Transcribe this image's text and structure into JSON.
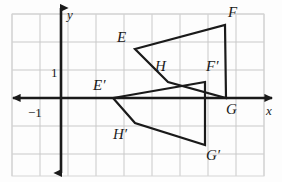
{
  "figure": {
    "width": 282,
    "height": 182,
    "background_color": "#fdfdfd",
    "grid": {
      "visible": true,
      "color": "#c9c9c9",
      "spacing_px": 28,
      "x_lines": [
        12,
        40,
        68,
        96,
        124,
        152,
        180,
        208,
        236,
        264
      ],
      "y_lines": [
        14,
        42,
        70,
        98,
        126,
        154
      ],
      "border_color": "#d5d5d5"
    },
    "axes": {
      "color": "#1a1a1a",
      "stroke_width": 2.6,
      "origin_px": [
        61,
        98
      ],
      "unit_px": 28,
      "x_axis": {
        "label": "x",
        "y_px": 98,
        "x_start_px": 13,
        "x_end_px": 272,
        "arrows": "both"
      },
      "y_axis": {
        "label": "y",
        "x_px": 61,
        "y_start_px": 8,
        "y_end_px": 173,
        "arrows": "both"
      }
    },
    "tick_labels": [
      {
        "text": "1",
        "axis": "y",
        "value": 1,
        "x_px": 51,
        "y_px": 66
      },
      {
        "text": "−1",
        "axis": "x",
        "value": -1,
        "x_px": 28,
        "y_px": 106
      }
    ],
    "shapes": [
      {
        "name": "preimage-EFGH",
        "label": "EFGH",
        "stroke": "#1a1a1a",
        "stroke_width": 2.2,
        "fill": "none",
        "closed": true,
        "vertices": [
          {
            "label": "E",
            "x_px": 135,
            "y_px": 49,
            "unit_x": 2.64,
            "unit_y": 1.75
          },
          {
            "label": "F",
            "x_px": 225,
            "y_px": 25,
            "unit_x": 5.86,
            "unit_y": 2.61
          },
          {
            "label": "G",
            "x_px": 226,
            "y_px": 98,
            "unit_x": 5.89,
            "unit_y": 0.0
          },
          {
            "label": "H",
            "x_px": 168,
            "y_px": 82,
            "unit_x": 3.82,
            "unit_y": 0.57
          }
        ]
      },
      {
        "name": "image-EFGH-prime",
        "label": "E'F'G'H'",
        "stroke": "#1a1a1a",
        "stroke_width": 2.2,
        "fill": "none",
        "closed": true,
        "vertices": [
          {
            "label": "E′",
            "x_px": 113,
            "y_px": 98,
            "unit_x": 1.86,
            "unit_y": 0.0
          },
          {
            "label": "F′",
            "x_px": 205,
            "y_px": 82,
            "unit_x": 5.14,
            "unit_y": 0.57
          },
          {
            "label": "G′",
            "x_px": 205,
            "y_px": 145,
            "unit_x": 5.14,
            "unit_y": -1.68
          },
          {
            "label": "H′",
            "x_px": 135,
            "y_px": 123,
            "unit_x": 2.64,
            "unit_y": -0.89
          }
        ]
      }
    ],
    "point_labels": [
      {
        "name": "label-E",
        "text": "E",
        "x_px": 117,
        "y_px": 30
      },
      {
        "name": "label-F",
        "text": "F",
        "x_px": 228,
        "y_px": 5
      },
      {
        "name": "label-G",
        "text": "G",
        "x_px": 226,
        "y_px": 102
      },
      {
        "name": "label-H",
        "text": "H",
        "x_px": 155,
        "y_px": 59
      },
      {
        "name": "label-E-prime",
        "text": "E′",
        "x_px": 93,
        "y_px": 78
      },
      {
        "name": "label-F-prime",
        "text": "F′",
        "x_px": 206,
        "y_px": 59
      },
      {
        "name": "label-G-prime",
        "text": "G′",
        "x_px": 206,
        "y_px": 148
      },
      {
        "name": "label-H-prime",
        "text": "H′",
        "x_px": 113,
        "y_px": 127
      }
    ],
    "axis_labels": [
      {
        "name": "label-y-axis",
        "text": "y",
        "x_px": 67,
        "y_px": 8
      },
      {
        "name": "label-x-axis",
        "text": "x",
        "x_px": 266,
        "y_px": 104
      }
    ]
  }
}
